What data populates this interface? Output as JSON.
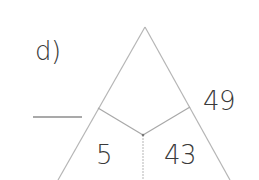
{
  "exercise": {
    "part_label": "d)",
    "answer_blank": "",
    "numbers": {
      "right_outside": "49",
      "bottom_left_cell": "5",
      "bottom_right_cell": "43"
    }
  },
  "colors": {
    "stroke": "#b5b5b5",
    "text": "#3a3a3a",
    "background": "#ffffff"
  }
}
